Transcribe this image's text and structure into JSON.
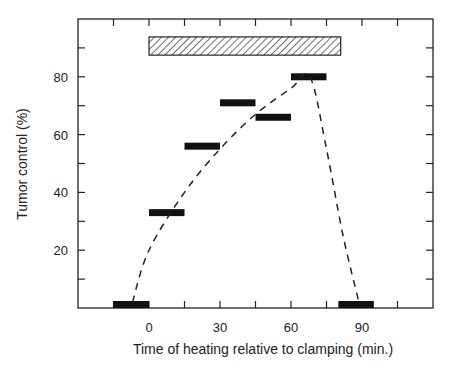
{
  "chart_data": {
    "type": "bar",
    "title": "",
    "xlabel": "Time of heating relative to clamping (min.)",
    "ylabel": "Tumor control (%)",
    "xlim": [
      -30,
      120
    ],
    "ylim": [
      0,
      100
    ],
    "x_tick_labels": [
      "0",
      "30",
      "60",
      "90"
    ],
    "x_tick_values": [
      0,
      30,
      60,
      90
    ],
    "x_minor_ticks": [
      -15,
      15,
      45,
      75,
      105
    ],
    "y_tick_labels": [
      "20",
      "40",
      "60",
      "80"
    ],
    "y_tick_values": [
      20,
      40,
      60,
      80
    ],
    "y_minor_ticks": [
      10,
      30,
      50,
      70,
      90
    ],
    "grid": false,
    "legend": null,
    "series": [
      {
        "name": "Tumor control per heating interval",
        "style": "horizontal black bars",
        "intervals": [
          {
            "x_start": -15,
            "x_end": 0,
            "value": 1
          },
          {
            "x_start": 0,
            "x_end": 15,
            "value": 33
          },
          {
            "x_start": 15,
            "x_end": 30,
            "value": 56
          },
          {
            "x_start": 30,
            "x_end": 45,
            "value": 71
          },
          {
            "x_start": 45,
            "x_end": 60,
            "value": 66
          },
          {
            "x_start": 60,
            "x_end": 75,
            "value": 80
          },
          {
            "x_start": 80,
            "x_end": 95,
            "value": 1
          }
        ]
      },
      {
        "name": "Trend curve",
        "style": "dashed line",
        "points": [
          [
            -7,
            2
          ],
          [
            0,
            20
          ],
          [
            15,
            40
          ],
          [
            30,
            55
          ],
          [
            45,
            67
          ],
          [
            60,
            76
          ],
          [
            68,
            80
          ],
          [
            75,
            55
          ],
          [
            82,
            25
          ],
          [
            89,
            1
          ]
        ]
      }
    ],
    "annotations": [
      {
        "type": "hatched bar",
        "label": "Clamping period",
        "x_start": 0,
        "x_end": 81,
        "y_range": [
          87.5,
          93.8
        ]
      }
    ]
  }
}
